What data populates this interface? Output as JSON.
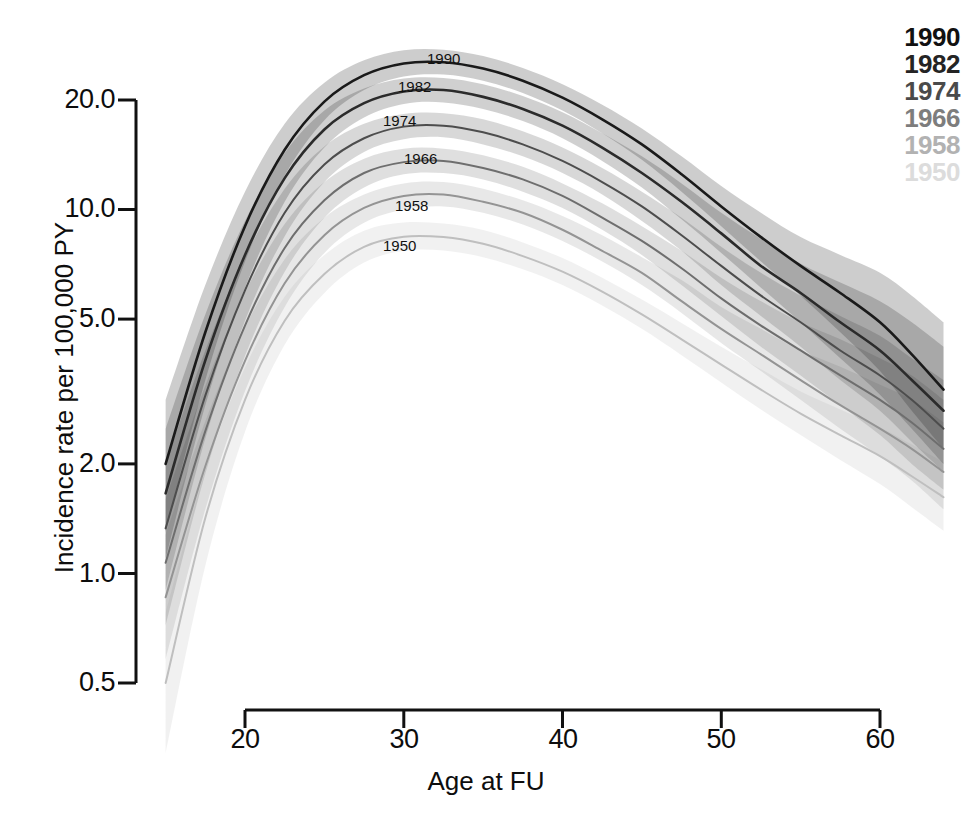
{
  "chart_data": {
    "type": "line",
    "title": "",
    "subtitle": "",
    "xlabel": "Age at FU",
    "ylabel": "Incidence rate per 100,000 PY",
    "xlim": [
      15,
      64
    ],
    "ylim": [
      0.5,
      26
    ],
    "yscale": "log",
    "grid": false,
    "legend_position": "top-right",
    "xticks": [
      20,
      30,
      40,
      50,
      60
    ],
    "xticklabels": [
      "20",
      "30",
      "40",
      "50",
      "60"
    ],
    "yticks": [
      0.5,
      1.0,
      2.0,
      5.0,
      10.0,
      20.0
    ],
    "yticklabels": [
      "0.5",
      "1.0",
      "2.0",
      "5.0",
      "10.0",
      "20.0"
    ],
    "annotations": [
      "1990",
      "1982",
      "1974",
      "1966",
      "1958",
      "1950"
    ],
    "band_description": "shaded confidence bands around each curve",
    "x": [
      15,
      17.5,
      20,
      22.5,
      25,
      27.5,
      30,
      32.5,
      35,
      37.5,
      40,
      42.5,
      45,
      47.5,
      50,
      52.5,
      55,
      57.5,
      60,
      62,
      64
    ],
    "series": [
      {
        "name": "1990",
        "color": "#1a1a1a",
        "values": [
          2.0,
          4.6,
          9.0,
          14.6,
          19.8,
          23.4,
          25.2,
          25.4,
          24.4,
          22.6,
          20.3,
          17.7,
          15.1,
          12.5,
          10.2,
          8.4,
          7.0,
          5.9,
          4.9,
          4.0,
          3.2
        ],
        "ci_low": [
          1.3,
          3.4,
          7.2,
          12.4,
          17.6,
          21.3,
          23.2,
          23.5,
          22.6,
          20.9,
          18.7,
          16.2,
          13.7,
          11.2,
          9.0,
          7.2,
          5.8,
          4.6,
          3.6,
          2.8,
          2.2
        ],
        "ci_high": [
          3.0,
          6.2,
          11.2,
          17.2,
          22.3,
          25.7,
          27.4,
          27.5,
          26.4,
          24.5,
          22.1,
          19.4,
          16.7,
          14.0,
          11.6,
          9.8,
          8.4,
          7.5,
          6.7,
          5.8,
          4.9
        ]
      },
      {
        "name": "1982",
        "color": "#2b2b2b",
        "values": [
          1.66,
          3.85,
          7.5,
          12.2,
          16.6,
          19.6,
          21.1,
          21.3,
          20.4,
          18.9,
          17.0,
          14.8,
          12.6,
          10.5,
          8.6,
          7.0,
          5.9,
          4.9,
          4.1,
          3.4,
          2.8
        ],
        "ci_low": [
          1.1,
          2.9,
          6.1,
          10.5,
          14.8,
          17.9,
          19.5,
          19.7,
          18.9,
          17.5,
          15.7,
          13.6,
          11.5,
          9.4,
          7.6,
          6.1,
          4.9,
          3.9,
          3.1,
          2.5,
          2.0
        ],
        "ci_high": [
          2.5,
          5.15,
          9.3,
          14.3,
          18.7,
          21.5,
          22.9,
          23.0,
          22.1,
          20.5,
          18.5,
          16.2,
          14.0,
          11.8,
          9.8,
          8.3,
          7.1,
          6.3,
          5.6,
          4.9,
          4.2
        ]
      },
      {
        "name": "1974",
        "color": "#4d4d4d",
        "values": [
          1.33,
          3.08,
          6.0,
          9.8,
          13.3,
          15.7,
          16.9,
          17.0,
          16.3,
          15.1,
          13.6,
          11.9,
          10.2,
          8.5,
          7.0,
          5.8,
          4.9,
          4.1,
          3.5,
          3.0,
          2.5
        ],
        "ci_low": [
          0.9,
          2.35,
          4.95,
          8.45,
          11.9,
          14.4,
          15.6,
          15.8,
          15.1,
          14.0,
          12.6,
          11.0,
          9.3,
          7.7,
          6.2,
          5.1,
          4.2,
          3.4,
          2.8,
          2.3,
          1.9
        ],
        "ci_high": [
          2.0,
          4.1,
          7.4,
          11.4,
          14.9,
          17.2,
          18.3,
          18.4,
          17.7,
          16.4,
          14.8,
          13.0,
          11.2,
          9.5,
          7.9,
          6.7,
          5.8,
          5.1,
          4.5,
          3.9,
          3.4
        ]
      },
      {
        "name": "1966",
        "color": "#6e6e6e",
        "values": [
          1.07,
          2.46,
          4.8,
          7.84,
          10.6,
          12.6,
          13.5,
          13.6,
          13.0,
          12.1,
          10.9,
          9.5,
          8.2,
          6.9,
          5.7,
          4.8,
          4.1,
          3.5,
          3.0,
          2.6,
          2.2
        ],
        "ci_low": [
          0.72,
          1.88,
          3.96,
          6.75,
          9.5,
          11.5,
          12.5,
          12.6,
          12.1,
          11.2,
          10.1,
          8.8,
          7.5,
          6.2,
          5.1,
          4.2,
          3.5,
          2.9,
          2.4,
          2.0,
          1.7
        ],
        "ci_high": [
          1.6,
          3.28,
          5.92,
          9.12,
          11.9,
          13.8,
          14.7,
          14.7,
          14.1,
          13.1,
          11.8,
          10.4,
          9.0,
          7.7,
          6.5,
          5.6,
          4.9,
          4.4,
          3.9,
          3.5,
          3.0
        ]
      },
      {
        "name": "1958",
        "color": "#949494",
        "values": [
          0.86,
          1.97,
          3.84,
          6.27,
          8.5,
          10.1,
          10.9,
          11.0,
          10.5,
          9.8,
          8.8,
          7.7,
          6.7,
          5.6,
          4.7,
          4.0,
          3.4,
          2.9,
          2.5,
          2.2,
          1.9
        ],
        "ci_low": [
          0.58,
          1.5,
          3.17,
          5.4,
          7.6,
          9.2,
          10.0,
          10.2,
          9.8,
          9.1,
          8.2,
          7.2,
          6.2,
          5.2,
          4.3,
          3.6,
          3.0,
          2.5,
          2.1,
          1.8,
          1.5
        ],
        "ci_high": [
          1.28,
          2.62,
          4.74,
          7.3,
          9.5,
          11.0,
          11.8,
          11.9,
          11.4,
          10.6,
          9.6,
          8.5,
          7.4,
          6.4,
          5.4,
          4.7,
          4.1,
          3.7,
          3.3,
          3.0,
          2.6
        ]
      },
      {
        "name": "1950",
        "color": "#bfbfbf",
        "values": [
          0.5,
          1.42,
          3.0,
          4.95,
          6.65,
          7.9,
          8.42,
          8.4,
          8.05,
          7.45,
          6.75,
          5.95,
          5.15,
          4.4,
          3.75,
          3.2,
          2.75,
          2.4,
          2.1,
          1.85,
          1.62
        ],
        "ci_low": [
          0.32,
          1.05,
          2.45,
          4.25,
          5.9,
          7.15,
          7.7,
          7.72,
          7.4,
          6.85,
          6.2,
          5.45,
          4.7,
          3.98,
          3.35,
          2.82,
          2.4,
          2.05,
          1.76,
          1.52,
          1.31
        ],
        "ci_high": [
          0.78,
          1.92,
          3.68,
          5.76,
          7.5,
          8.75,
          9.22,
          9.15,
          8.78,
          8.12,
          7.36,
          6.5,
          5.66,
          4.88,
          4.2,
          3.64,
          3.16,
          2.82,
          2.52,
          2.26,
          2.02
        ]
      }
    ]
  },
  "axes": {
    "xlabel": "Age at FU",
    "ylabel": "Incidence rate per 100,000 PY",
    "xticks": [
      "20",
      "30",
      "40",
      "50",
      "60"
    ],
    "yticks": [
      "20.0",
      "10.0",
      "5.0",
      "2.0",
      "1.0",
      "0.5"
    ]
  },
  "legend": {
    "items": [
      {
        "label": "1990",
        "color": "#111111"
      },
      {
        "label": "1982",
        "color": "#242424"
      },
      {
        "label": "1974",
        "color": "#4a4a4a"
      },
      {
        "label": "1966",
        "color": "#7d7d7d"
      },
      {
        "label": "1958",
        "color": "#b2b2b2"
      },
      {
        "label": "1950",
        "color": "#dcdcdc"
      }
    ]
  },
  "curve_labels": [
    {
      "label": "1990"
    },
    {
      "label": "1982"
    },
    {
      "label": "1974"
    },
    {
      "label": "1966"
    },
    {
      "label": "1958"
    },
    {
      "label": "1950"
    }
  ]
}
